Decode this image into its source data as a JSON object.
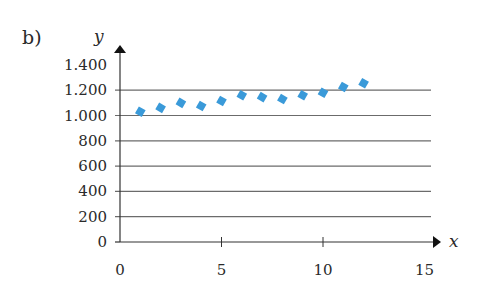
{
  "panel_label": "b)",
  "chart_data": {
    "type": "scatter",
    "title": "",
    "xlabel": "x",
    "ylabel": "y",
    "xlim": [
      0,
      15
    ],
    "ylim": [
      0,
      1400
    ],
    "x_ticks": [
      0,
      5,
      10,
      15
    ],
    "x_tick_labels": [
      "0",
      "5",
      "10",
      "15"
    ],
    "y_ticks": [
      0,
      200,
      400,
      600,
      800,
      1000,
      1200,
      1400
    ],
    "y_tick_labels": [
      "0",
      "200",
      "400",
      "600",
      "800",
      "1.000",
      "1.200",
      "1.400"
    ],
    "grid": true,
    "legend": null,
    "marker": "diamond",
    "marker_color": "#3a9ad9",
    "series": [
      {
        "name": "data",
        "x": [
          1,
          2,
          3,
          4,
          5,
          6,
          7,
          8,
          9,
          10,
          11,
          12
        ],
        "y": [
          1030,
          1060,
          1100,
          1075,
          1115,
          1160,
          1145,
          1130,
          1160,
          1180,
          1225,
          1255
        ]
      }
    ]
  }
}
